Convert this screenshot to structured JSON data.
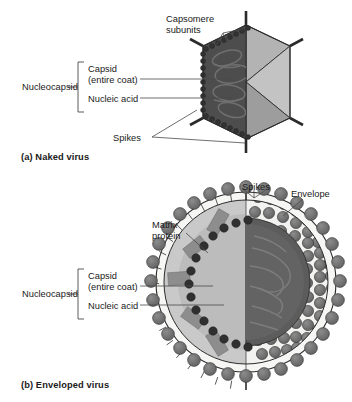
{
  "figure": {
    "background_color": "#ffffff"
  },
  "panel_a": {
    "caption": "(a) Naked virus",
    "bracket_label": "Nucleocapsid",
    "labels": {
      "capsomere": "Capsomere",
      "capsomere_line2": "subunits",
      "capsid": "Capsid",
      "capsid_line2": "(entire coat)",
      "nucleic_acid": "Nucleic acid",
      "spikes": "Spikes"
    }
  },
  "panel_b": {
    "caption": "(b) Enveloped virus",
    "bracket_label": "Nucleocapsid",
    "labels": {
      "spikes": "Spikes",
      "envelope": "Envelope",
      "matrix": "Matrix",
      "matrix_line2": "protein",
      "capsid": "Capsid",
      "capsid_line2": "(entire coat)",
      "nucleic_acid": "Nucleic acid"
    }
  },
  "colors": {
    "facet_light": "#b9b9b9",
    "facet_mid": "#9a9a9a",
    "facet_dark": "#7e7e7e",
    "capsid_dark": "#4f4f4f",
    "capsomere": "#3c3c3c",
    "nucleic_acid": "#5a5a5a",
    "envelope_white": "#f4f4f2",
    "matrix_light": "#c4c4c4",
    "matrix_block": "#8f8f8f",
    "spike_ball": "#6e6e6e",
    "spike_ball_edge": "#3a3a3a",
    "stroke": "#2b2b2b",
    "leader": "#4a4a4a",
    "text": "#1a1a1a"
  }
}
